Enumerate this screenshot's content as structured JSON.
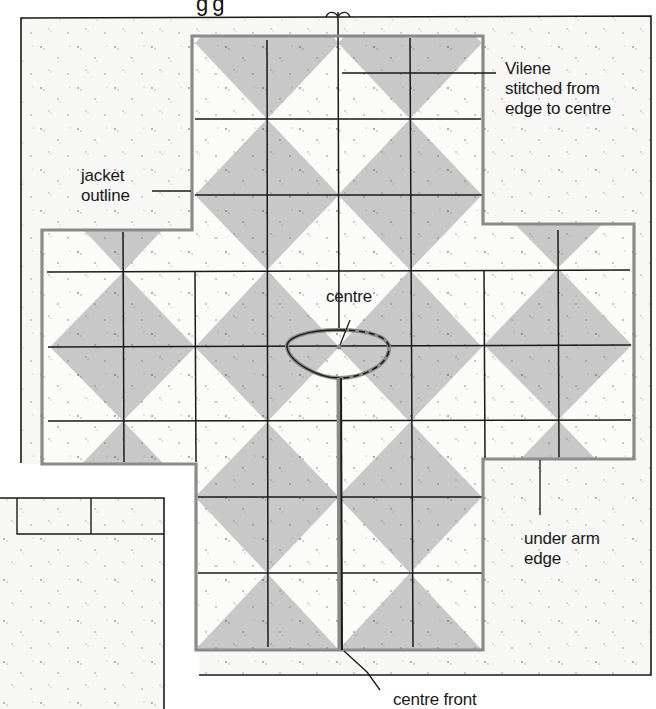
{
  "diagram": {
    "title_fragment": "gg",
    "colors": {
      "paper": "#f7f7f5",
      "outer_frame": "#1a1a1a",
      "jacket_outline": "#8a8a8a",
      "diamond_fill": "#c8c8c8",
      "grid_line": "#1a1a1a",
      "page_bg": "#ffffff"
    },
    "labels": {
      "vilene": "Vilene\nstitched from\nedge to centre",
      "jacket_outline": "jacket\noutline",
      "centre": "centre",
      "under_arm_edge": "under arm\nedge",
      "centre_front": "centre front"
    },
    "parts": [
      {
        "name": "outer-sheet",
        "description": "Vilene backing sheet"
      },
      {
        "name": "jacket-outline",
        "description": "cross-shaped jacket outline with diamond grid"
      },
      {
        "name": "neck-opening",
        "description": "oval neckline around centre"
      },
      {
        "name": "centre-front-line",
        "description": "slit from neckline to bottom edge"
      },
      {
        "name": "lower-left-sheet",
        "description": "second backing sheet with two top cells"
      }
    ]
  }
}
